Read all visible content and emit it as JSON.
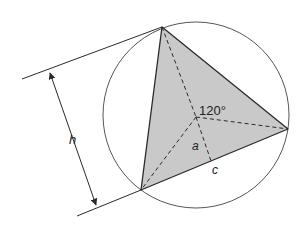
{
  "diagram": {
    "labels": {
      "angle": "120°",
      "apothem": "a",
      "side": "c",
      "height": "h"
    },
    "colors": {
      "stroke": "#2a2a2a",
      "fill": "#c9c9c9",
      "circle": "#555555",
      "background": "#ffffff"
    },
    "geometry": {
      "circle_center": [
        196,
        115
      ],
      "circle_radius": 93,
      "vertices": {
        "top": [
          162,
          27
        ],
        "right": [
          288,
          129
        ],
        "bottom_left": [
          141,
          190
        ]
      },
      "centroid": [
        196,
        117
      ],
      "side_midpoint": [
        211,
        161
      ]
    }
  }
}
